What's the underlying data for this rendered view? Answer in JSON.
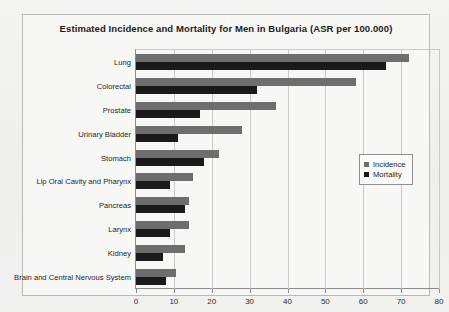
{
  "chart_data": {
    "type": "bar",
    "orientation": "horizontal",
    "title": "Estimated Incidence and Mortality for Men in Bulgaria (ASR per 100.000)",
    "xlabel": "",
    "ylabel": "",
    "xlim": [
      0,
      80
    ],
    "xticks": [
      0,
      10,
      20,
      30,
      40,
      50,
      60,
      70,
      80
    ],
    "xtick_labels": [
      "0",
      "10",
      "20",
      "30",
      "40",
      "50",
      "60",
      "70",
      "80"
    ],
    "grid": true,
    "legend_position": "center-right",
    "categories": [
      "Lung",
      "Colorectal",
      "Prostate",
      "Urinary Bladder",
      "Stomach",
      "Lip Oral Cavity and Pharynx",
      "Pancreas",
      "Larynx",
      "Kidney",
      "Brain and Central Nervous System"
    ],
    "series": [
      {
        "name": "Incidence",
        "color": "#6e6e6e",
        "values": [
          72,
          58,
          37,
          28,
          22,
          15,
          14,
          14,
          13,
          10.5
        ]
      },
      {
        "name": "Mortality",
        "color": "#1a1a1a",
        "values": [
          66,
          32,
          17,
          11,
          18,
          9,
          13,
          9,
          7,
          8
        ]
      }
    ]
  },
  "legend": {
    "items": [
      {
        "label": "Incidence",
        "swatch": "incidence"
      },
      {
        "label": "Mortality",
        "swatch": "mortality"
      }
    ]
  }
}
